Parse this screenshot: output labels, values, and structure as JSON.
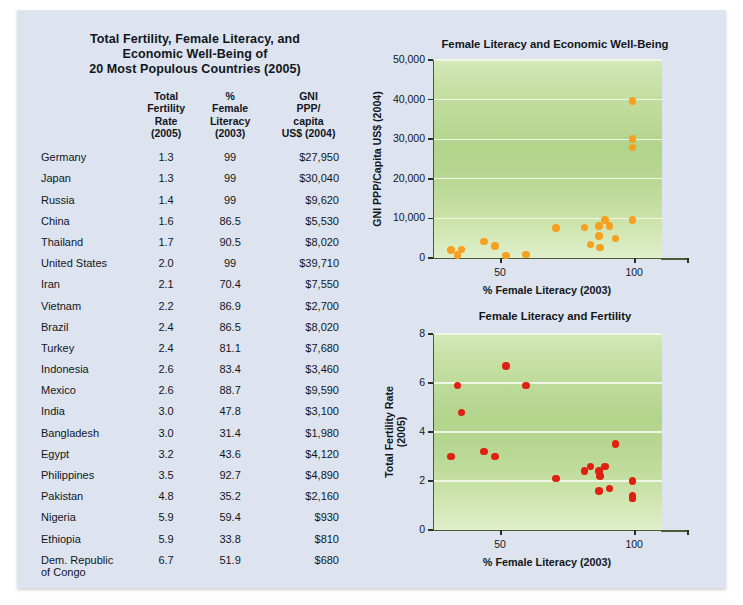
{
  "table": {
    "title_lines": [
      "Total Fertility, Female Literacy, and",
      "Economic Well-Being of",
      "20 Most Populous Countries (2005)"
    ],
    "headers": {
      "country": "",
      "tfr": "Total\nFertility\nRate\n(2005)",
      "tfr_lines": [
        "Total",
        "Fertility",
        "Rate",
        "(2005)"
      ],
      "literacy_lines": [
        "%",
        "Female",
        "Literacy",
        "(2003)"
      ],
      "gni_lines": [
        "GNI",
        "PPP/",
        "capita",
        "US$ (2004)"
      ]
    },
    "rows": [
      {
        "country": "Germany",
        "tfr": "1.3",
        "literacy": "99",
        "gni": "$27,950"
      },
      {
        "country": "Japan",
        "tfr": "1.3",
        "literacy": "99",
        "gni": "$30,040"
      },
      {
        "country": "Russia",
        "tfr": "1.4",
        "literacy": "99",
        "gni": "$9,620"
      },
      {
        "country": "China",
        "tfr": "1.6",
        "literacy": "86.5",
        "gni": "$5,530"
      },
      {
        "country": "Thailand",
        "tfr": "1.7",
        "literacy": "90.5",
        "gni": "$8,020"
      },
      {
        "country": "United States",
        "tfr": "2.0",
        "literacy": "99",
        "gni": "$39,710"
      },
      {
        "country": "Iran",
        "tfr": "2.1",
        "literacy": "70.4",
        "gni": "$7,550"
      },
      {
        "country": "Vietnam",
        "tfr": "2.2",
        "literacy": "86.9",
        "gni": "$2,700"
      },
      {
        "country": "Brazil",
        "tfr": "2.4",
        "literacy": "86.5",
        "gni": "$8,020"
      },
      {
        "country": "Turkey",
        "tfr": "2.4",
        "literacy": "81.1",
        "gni": "$7,680"
      },
      {
        "country": "Indonesia",
        "tfr": "2.6",
        "literacy": "83.4",
        "gni": "$3,460"
      },
      {
        "country": "Mexico",
        "tfr": "2.6",
        "literacy": "88.7",
        "gni": "$9,590"
      },
      {
        "country": "India",
        "tfr": "3.0",
        "literacy": "47.8",
        "gni": "$3,100"
      },
      {
        "country": "Bangladesh",
        "tfr": "3.0",
        "literacy": "31.4",
        "gni": "$1,980"
      },
      {
        "country": "Egypt",
        "tfr": "3.2",
        "literacy": "43.6",
        "gni": "$4,120"
      },
      {
        "country": "Philippines",
        "tfr": "3.5",
        "literacy": "92.7",
        "gni": "$4,890"
      },
      {
        "country": "Pakistan",
        "tfr": "4.8",
        "literacy": "35.2",
        "gni": "$2,160"
      },
      {
        "country": "Nigeria",
        "tfr": "5.9",
        "literacy": "59.4",
        "gni": "$930"
      },
      {
        "country": "Ethiopia",
        "tfr": "5.9",
        "literacy": "33.8",
        "gni": "$810"
      },
      {
        "country": "Dem. Republic of Congo",
        "tfr": "6.7",
        "literacy": "51.9",
        "gni": "$680"
      }
    ]
  },
  "colors": {
    "page_background": "#dde4ef",
    "plot_green_light": "#d4e8b8",
    "plot_green_dark": "#b2d48b",
    "dot_orange": "#f5a020",
    "dot_red": "#e02010",
    "gridline": "#f2f7e8",
    "axis": "#4a5a36"
  },
  "chart_data": [
    {
      "id": "economic",
      "type": "scatter",
      "title": "Female Literacy and Economic Well-Being",
      "xlabel": "% Female Literacy (2003)",
      "ylabel": "GNI PPP/Capita US$ (2004)",
      "xlim": [
        25,
        110
      ],
      "ylim": [
        0,
        50000
      ],
      "xticks": [
        50,
        100
      ],
      "xtick_labels": [
        "50",
        "100"
      ],
      "yticks": [
        0,
        10000,
        20000,
        30000,
        40000,
        50000
      ],
      "ytick_labels": [
        "0",
        "10,000",
        "20,000",
        "30,000",
        "40,000",
        "50,000"
      ],
      "grid": true,
      "marker_color": "#f5a020",
      "points": [
        {
          "label": "Germany",
          "x": 99,
          "y": 27950
        },
        {
          "label": "Japan",
          "x": 99,
          "y": 30040
        },
        {
          "label": "Russia",
          "x": 99,
          "y": 9620
        },
        {
          "label": "China",
          "x": 86.5,
          "y": 5530
        },
        {
          "label": "Thailand",
          "x": 90.5,
          "y": 8020
        },
        {
          "label": "United States",
          "x": 99,
          "y": 39710
        },
        {
          "label": "Iran",
          "x": 70.4,
          "y": 7550
        },
        {
          "label": "Vietnam",
          "x": 86.9,
          "y": 2700
        },
        {
          "label": "Brazil",
          "x": 86.5,
          "y": 8020
        },
        {
          "label": "Turkey",
          "x": 81.1,
          "y": 7680
        },
        {
          "label": "Indonesia",
          "x": 83.4,
          "y": 3460
        },
        {
          "label": "Mexico",
          "x": 88.7,
          "y": 9590
        },
        {
          "label": "India",
          "x": 47.8,
          "y": 3100
        },
        {
          "label": "Bangladesh",
          "x": 31.4,
          "y": 1980
        },
        {
          "label": "Egypt",
          "x": 43.6,
          "y": 4120
        },
        {
          "label": "Philippines",
          "x": 92.7,
          "y": 4890
        },
        {
          "label": "Pakistan",
          "x": 35.2,
          "y": 2160
        },
        {
          "label": "Nigeria",
          "x": 59.4,
          "y": 930
        },
        {
          "label": "Ethiopia",
          "x": 33.8,
          "y": 810
        },
        {
          "label": "Dem. Republic of Congo",
          "x": 51.9,
          "y": 680
        }
      ]
    },
    {
      "id": "fertility",
      "type": "scatter",
      "title": "Female Literacy and Fertility",
      "xlabel": "% Female Literacy (2003)",
      "ylabel": "Total Fertility Rate (2005)",
      "ylabel_lines": [
        "Total Fertility Rate",
        "(2005)"
      ],
      "xlim": [
        25,
        110
      ],
      "ylim": [
        0,
        8
      ],
      "xticks": [
        50,
        100
      ],
      "xtick_labels": [
        "50",
        "100"
      ],
      "yticks": [
        0,
        2,
        4,
        6,
        8
      ],
      "ytick_labels": [
        "0",
        "2",
        "4",
        "6",
        "8"
      ],
      "grid": true,
      "marker_color": "#e02010",
      "points": [
        {
          "label": "Germany",
          "x": 99,
          "y": 1.3
        },
        {
          "label": "Japan",
          "x": 99,
          "y": 1.3
        },
        {
          "label": "Russia",
          "x": 99,
          "y": 1.4
        },
        {
          "label": "China",
          "x": 86.5,
          "y": 1.6
        },
        {
          "label": "Thailand",
          "x": 90.5,
          "y": 1.7
        },
        {
          "label": "United States",
          "x": 99,
          "y": 2.0
        },
        {
          "label": "Iran",
          "x": 70.4,
          "y": 2.1
        },
        {
          "label": "Vietnam",
          "x": 86.9,
          "y": 2.2
        },
        {
          "label": "Brazil",
          "x": 86.5,
          "y": 2.4
        },
        {
          "label": "Turkey",
          "x": 81.1,
          "y": 2.4
        },
        {
          "label": "Indonesia",
          "x": 83.4,
          "y": 2.6
        },
        {
          "label": "Mexico",
          "x": 88.7,
          "y": 2.6
        },
        {
          "label": "India",
          "x": 47.8,
          "y": 3.0
        },
        {
          "label": "Bangladesh",
          "x": 31.4,
          "y": 3.0
        },
        {
          "label": "Egypt",
          "x": 43.6,
          "y": 3.2
        },
        {
          "label": "Philippines",
          "x": 92.7,
          "y": 3.5
        },
        {
          "label": "Pakistan",
          "x": 35.2,
          "y": 4.8
        },
        {
          "label": "Nigeria",
          "x": 59.4,
          "y": 5.9
        },
        {
          "label": "Ethiopia",
          "x": 33.8,
          "y": 5.9
        },
        {
          "label": "Dem. Republic of Congo",
          "x": 51.9,
          "y": 6.7
        }
      ]
    }
  ]
}
